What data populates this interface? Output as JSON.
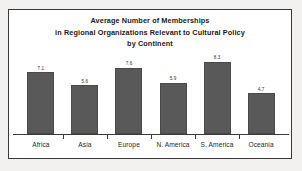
{
  "chart_data": {
    "type": "bar",
    "title": "Average Number of Memberships in Regional Organizations Relevant to Cultural Policy by Continent",
    "title_lines": [
      "Average Number of Memberships",
      "in Regional Organizations Relevant to Cultural Policy",
      "by Continent"
    ],
    "categories": [
      "Africa",
      "Asia",
      "Europe",
      "N. America",
      "S. America",
      "Oceania"
    ],
    "values": [
      7.1,
      5.6,
      7.6,
      5.9,
      8.3,
      4.7
    ],
    "value_labels": [
      "7.1",
      "5.6",
      "7.6",
      "5.9",
      "8.3",
      "4.7"
    ],
    "xlabel": "",
    "ylabel": "",
    "ylim": [
      0,
      9.2
    ],
    "grid": false,
    "legend": false,
    "series": [
      {
        "name": "Average Number of Memberships",
        "values": [
          7.1,
          5.6,
          7.6,
          5.9,
          8.3,
          4.7
        ]
      }
    ],
    "colors": {
      "bar_fill": "#595959",
      "bar_border": "#4a4a4a",
      "axis": "#3a3a3a",
      "frame": "#3a3a3a",
      "plot_background": "#ffffff",
      "page_background": "#f2f1ef",
      "title_text": "#1b1b1b",
      "label_text": "#1f1f1f"
    }
  }
}
